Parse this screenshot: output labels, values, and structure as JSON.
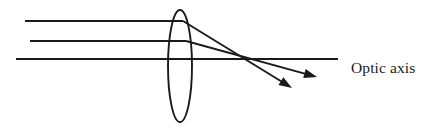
{
  "figure": {
    "kind": "optics-ray-diagram",
    "title_text": "",
    "background_color": "#ffffff",
    "stroke_color": "#1a1a1a",
    "width": 433,
    "height": 128
  },
  "labels": {
    "optic_axis": "Optic axis"
  },
  "lens": {
    "name": "converging-lens",
    "center_x": 180,
    "center_y": 66,
    "radius_x": 12,
    "radius_y": 56
  },
  "focal_point": {
    "x": 244,
    "y": 59
  },
  "incident_rays": [
    {
      "name": "upper-parallel-ray",
      "x1": 25,
      "y1": 21,
      "x2": 183,
      "y2": 21
    },
    {
      "name": "middle-parallel-ray",
      "x1": 30,
      "y1": 41,
      "x2": 186,
      "y2": 41
    },
    {
      "name": "optic-axis-ray",
      "x1": 16,
      "y1": 59,
      "x2": 338,
      "y2": 59
    }
  ],
  "refracted_rays": [
    {
      "name": "upper-refracted-ray",
      "x1": 183,
      "y1": 21,
      "x2": 292,
      "y2": 88
    },
    {
      "name": "middle-refracted-ray",
      "x1": 186,
      "y1": 41,
      "x2": 317,
      "y2": 77
    }
  ],
  "arrow_heads": [
    {
      "name": "upper-refracted-arrow",
      "tip_x": 292,
      "tip_y": 88,
      "angle_deg": 31.6
    },
    {
      "name": "middle-refracted-arrow",
      "tip_x": 317,
      "tip_y": 77,
      "angle_deg": 15.4
    }
  ]
}
